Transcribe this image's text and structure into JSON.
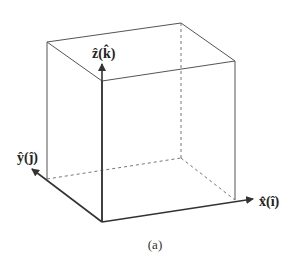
{
  "figure": {
    "caption": "(a)",
    "colors": {
      "edge": "#555555",
      "axis": "#333333",
      "hidden": "#666666"
    },
    "cube": {
      "vertices": {
        "origin": [
          102,
          222
        ],
        "front_top_left": [
          102,
          81
        ],
        "back_top_left": [
          47,
          42
        ],
        "back_top_right": [
          181,
          23
        ],
        "front_top_right": [
          235,
          61
        ],
        "front_bottom_right": [
          235,
          200
        ],
        "back_bottom_left": [
          47,
          179
        ],
        "hidden_back_bottom": [
          181,
          158
        ]
      }
    },
    "axes": [
      {
        "name": "z",
        "label": "ẑ(k̂)",
        "from": [
          102,
          222
        ],
        "to": [
          102,
          64
        ]
      },
      {
        "name": "y",
        "label": "ŷ(ĵ)",
        "from": [
          102,
          222
        ],
        "to": [
          32,
          169
        ]
      },
      {
        "name": "x",
        "label": "x̂(î)",
        "from": [
          102,
          222
        ],
        "to": [
          253,
          199
        ]
      }
    ],
    "labels": {
      "z": "ẑ(k̂)",
      "y": "ŷ(ĵ)",
      "x": "x̂(î)"
    }
  }
}
